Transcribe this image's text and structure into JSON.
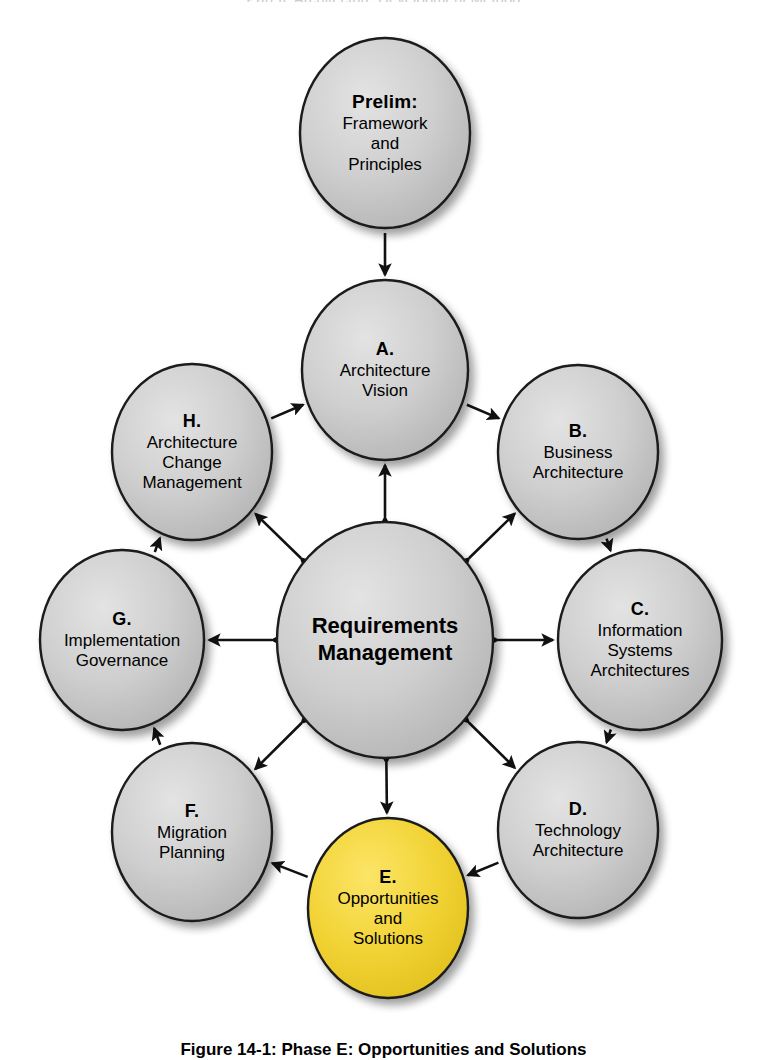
{
  "diagram": {
    "type": "cycle-diagram",
    "background_color": "#ffffff",
    "node_fill_default": "#c8c8c8",
    "node_fill_highlight": "#f2d335",
    "node_stroke": "#1a1a1a",
    "arrow_color": "#111111",
    "nodes": [
      {
        "id": "prelim",
        "code": "Prelim:",
        "name": "Framework\nand\nPrinciples",
        "name_lines": [
          "Framework",
          "and",
          "Principles"
        ],
        "fill": "#c8c8c8",
        "cx": 385,
        "cy": 133,
        "rx": 85,
        "ry": 95,
        "highlighted": false
      },
      {
        "id": "a",
        "code": "A.",
        "name": "Architecture\nVision",
        "name_lines": [
          "Architecture",
          "Vision"
        ],
        "fill": "#c8c8c8",
        "cx": 385,
        "cy": 370,
        "rx": 83,
        "ry": 90,
        "highlighted": false
      },
      {
        "id": "b",
        "code": "B.",
        "name": "Business\nArchitecture",
        "name_lines": [
          "Business",
          "Architecture"
        ],
        "fill": "#c8c8c8",
        "cx": 578,
        "cy": 452,
        "rx": 80,
        "ry": 87,
        "highlighted": false
      },
      {
        "id": "c",
        "code": "C.",
        "name": "Information\nSystems\nArchitectures",
        "name_lines": [
          "Information",
          "Systems",
          "Architectures"
        ],
        "fill": "#c8c8c8",
        "cx": 640,
        "cy": 640,
        "rx": 82,
        "ry": 90,
        "highlighted": false
      },
      {
        "id": "d",
        "code": "D.",
        "name": "Technology\nArchitecture",
        "name_lines": [
          "Technology",
          "Architecture"
        ],
        "fill": "#c8c8c8",
        "cx": 578,
        "cy": 830,
        "rx": 80,
        "ry": 88,
        "highlighted": false
      },
      {
        "id": "e",
        "code": "E.",
        "name": "Opportunities\nand\nSolutions",
        "name_lines": [
          "Opportunities",
          "and",
          "Solutions"
        ],
        "fill": "#f2d335",
        "cx": 388,
        "cy": 908,
        "rx": 80,
        "ry": 90,
        "highlighted": true
      },
      {
        "id": "f",
        "code": "F.",
        "name": "Migration\nPlanning",
        "name_lines": [
          "Migration",
          "Planning"
        ],
        "fill": "#c8c8c8",
        "cx": 192,
        "cy": 832,
        "rx": 80,
        "ry": 89,
        "highlighted": false
      },
      {
        "id": "g",
        "code": "G.",
        "name": "Implementation\nGovernance",
        "name_lines": [
          "Implementation",
          "Governance"
        ],
        "fill": "#c8c8c8",
        "cx": 122,
        "cy": 640,
        "rx": 82,
        "ry": 90,
        "highlighted": false
      },
      {
        "id": "h",
        "code": "H.",
        "name": "Architecture\nChange\nManagement",
        "name_lines": [
          "Architecture",
          "Change",
          "Management"
        ],
        "fill": "#c8c8c8",
        "cx": 192,
        "cy": 452,
        "rx": 80,
        "ry": 88,
        "highlighted": false
      },
      {
        "id": "center",
        "code": "",
        "name": "Requirements\nManagement",
        "name_lines": [
          "Requirements",
          "Management"
        ],
        "fill": "#c8c8c8",
        "cx": 385,
        "cy": 640,
        "rx": 108,
        "ry": 118,
        "highlighted": false
      }
    ],
    "edges": [
      {
        "id": "prelim-a",
        "from": "prelim",
        "to": "a",
        "style": "single",
        "label": ""
      },
      {
        "id": "h-a",
        "from": "h",
        "to": "a",
        "style": "single",
        "label": ""
      },
      {
        "id": "a-b",
        "from": "a",
        "to": "b",
        "style": "single",
        "label": ""
      },
      {
        "id": "b-c",
        "from": "b",
        "to": "c",
        "style": "single",
        "label": ""
      },
      {
        "id": "c-d",
        "from": "c",
        "to": "d",
        "style": "single",
        "label": ""
      },
      {
        "id": "d-e",
        "from": "d",
        "to": "e",
        "style": "single",
        "label": ""
      },
      {
        "id": "e-f",
        "from": "e",
        "to": "f",
        "style": "single",
        "label": ""
      },
      {
        "id": "f-g",
        "from": "f",
        "to": "g",
        "style": "single",
        "label": ""
      },
      {
        "id": "g-h",
        "from": "g",
        "to": "h",
        "style": "single",
        "label": ""
      },
      {
        "id": "center-a",
        "from": "center",
        "to": "a",
        "style": "double",
        "label": ""
      },
      {
        "id": "center-b",
        "from": "center",
        "to": "b",
        "style": "double",
        "label": ""
      },
      {
        "id": "center-c",
        "from": "center",
        "to": "c",
        "style": "double",
        "label": ""
      },
      {
        "id": "center-d",
        "from": "center",
        "to": "d",
        "style": "double",
        "label": ""
      },
      {
        "id": "center-e",
        "from": "center",
        "to": "e",
        "style": "double",
        "label": ""
      },
      {
        "id": "center-f",
        "from": "center",
        "to": "f",
        "style": "double",
        "label": ""
      },
      {
        "id": "center-g",
        "from": "center",
        "to": "g",
        "style": "double",
        "label": ""
      },
      {
        "id": "center-h",
        "from": "center",
        "to": "h",
        "style": "double",
        "label": ""
      }
    ]
  },
  "caption": {
    "text": "Figure 14-1: Phase E: Opportunities and Solutions"
  },
  "top_clipped_text": {
    "text": "Part II: Architecture Development Method"
  }
}
